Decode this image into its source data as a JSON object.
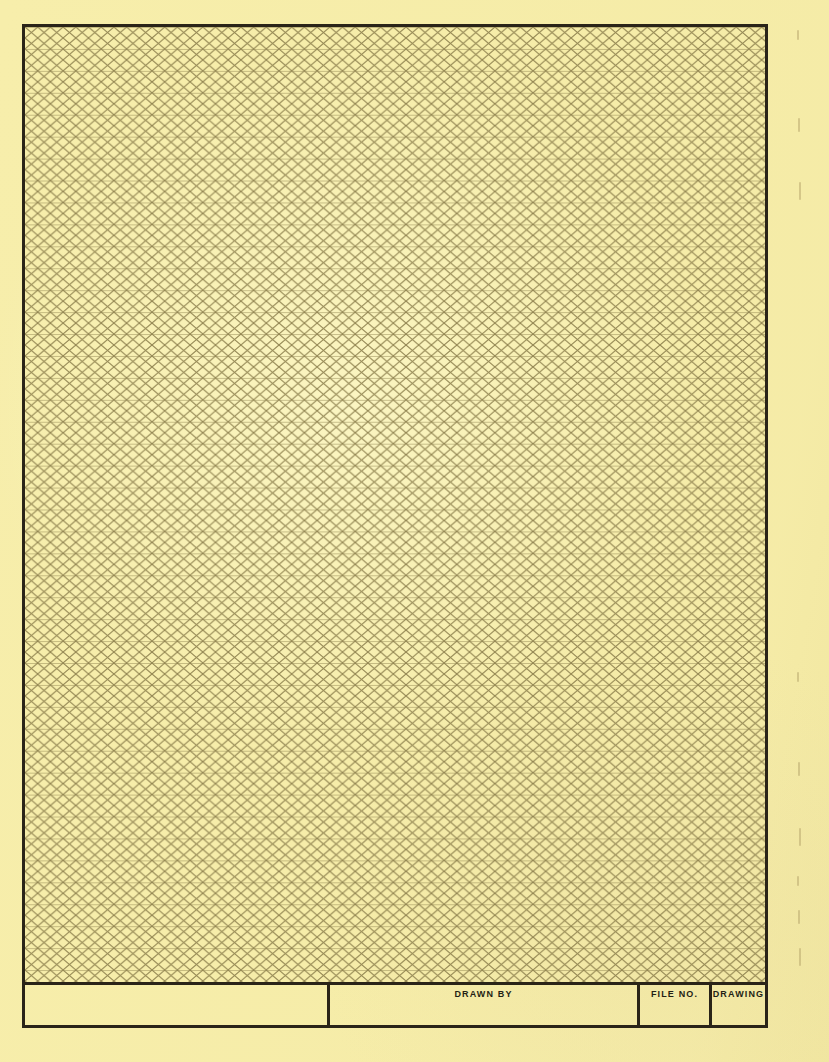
{
  "sheet": {
    "kind": "isometric-triangular-graph-paper",
    "width": 829,
    "height": 1062,
    "paper_color": "#f7eeab",
    "border_color": "#2a2418",
    "grid_line_color": "#8a7d4a"
  },
  "frame": {
    "left": 22,
    "top": 24,
    "width": 746,
    "height": 1004,
    "border_width": 3
  },
  "grid": {
    "type": "isometric",
    "row_spacing": 22,
    "column_spacing": 25.4,
    "diagonal_angle_degrees": 60,
    "line_color": "#8a7d4a",
    "line_width": 1
  },
  "title_block": {
    "height": 43,
    "cells": [
      {
        "name": "blank",
        "label": "",
        "width": 305
      },
      {
        "name": "drawn-by",
        "label": "DRAWN BY",
        "width": 310
      },
      {
        "name": "file-no",
        "label": "FILE NO.",
        "width": 72
      },
      {
        "name": "drawing",
        "label": "DRAWING",
        "width": 59
      }
    ]
  },
  "margin_marks": {
    "count": 9,
    "positions_y": [
      30,
      118,
      182,
      672,
      762,
      828,
      876,
      910,
      948
    ],
    "color": "#b9a970"
  }
}
